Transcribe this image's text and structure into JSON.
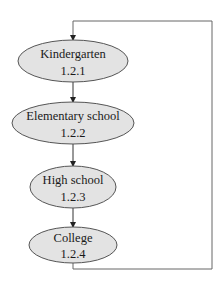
{
  "diagram": {
    "type": "flowchart",
    "nodes": [
      {
        "id": "n1",
        "label": "Kindergarten",
        "code": "1.2.1"
      },
      {
        "id": "n2",
        "label": "Elementary school",
        "code": "1.2.2"
      },
      {
        "id": "n3",
        "label": "High school",
        "code": "1.2.3"
      },
      {
        "id": "n4",
        "label": "College",
        "code": "1.2.4"
      }
    ],
    "edges": [
      {
        "from": "n1",
        "to": "n2"
      },
      {
        "from": "n2",
        "to": "n3"
      },
      {
        "from": "n3",
        "to": "n4"
      },
      {
        "from": "n4",
        "to": "n1",
        "style": "loop-back via right side"
      }
    ],
    "colors": {
      "node_fill": "#e3e3e3",
      "node_stroke": "#555555",
      "edge": "#333333",
      "loop_line": "#666666"
    }
  }
}
